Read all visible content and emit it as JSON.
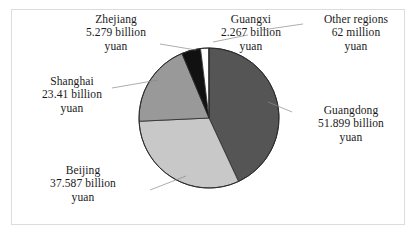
{
  "chart_data": {
    "type": "pie",
    "title": "",
    "unit": "yuan",
    "legend_position": "callout-labels",
    "total_billion_yuan": 120.504,
    "categories": [
      "Guangdong",
      "Beijing",
      "Shanghai",
      "Zhejiang",
      "Guangxi",
      "Other regions"
    ],
    "values": [
      51.899,
      37.587,
      23.41,
      5.279,
      2.267,
      0.062
    ],
    "value_labels": [
      "51.899 billion yuan",
      "37.587 billion yuan",
      "23.41 billion yuan",
      "5.279 billion yuan",
      "2.267 billion yuan",
      "62 million yuan"
    ],
    "colors": [
      "#555555",
      "#c8c8c8",
      "#999999",
      "#111111",
      "#fdfdfd",
      "#fdfdfd"
    ],
    "start_angle_deg": 0,
    "direction": "clockwise",
    "slice_angles_deg": [
      155.06,
      112.29,
      69.94,
      15.77,
      6.77,
      0.19
    ]
  },
  "labels": {
    "zhejiang": {
      "name": "Zhejiang",
      "line2": "5.279 billion",
      "line3": "yuan"
    },
    "guangxi": {
      "name": "Guangxi",
      "line2": "2.267 billion",
      "line3": "yuan"
    },
    "other": {
      "name": "Other regions",
      "line2": "62 million",
      "line3": "yuan"
    },
    "shanghai": {
      "name": "Shanghai",
      "line2": "23.41 billion",
      "line3": "yuan"
    },
    "beijing": {
      "name": "Beijing",
      "line2": "37.587 billion",
      "line3": "yuan"
    },
    "guangdong": {
      "name": "Guangdong",
      "line2": "51.899 billion",
      "line3": "yuan"
    }
  }
}
